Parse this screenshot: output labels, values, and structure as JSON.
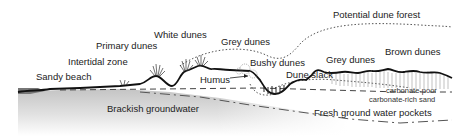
{
  "diagram": {
    "type": "coastal dune cross-section",
    "labels": {
      "sandy_beach": "Sandy beach",
      "intertidal_zone": "Intertidal zone",
      "primary_dunes": "Primary dunes",
      "white_dunes": "White dunes",
      "grey_dunes_left": "Grey dunes",
      "humus": "Humus",
      "bushy_dunes": "Bushy dunes",
      "dune_slack": "Dune slack",
      "grey_dunes_right": "Grey dunes",
      "potential_dune_forest": "Potential dune forest",
      "brown_dunes": "Brown dunes",
      "carbonate_poor": "carbonate-poor",
      "carbonate_rich_sand": "carbonate-rich sand",
      "brackish_groundwater": "Brackish groundwater",
      "fresh_ground_water_pockets": "Fresh ground water pockets"
    },
    "colors": {
      "ground_line": "#111111",
      "groundwater_fill": "#cfcfcf",
      "dashed_line": "#444444",
      "dotted_line": "#555555",
      "vegetation": "#333333"
    }
  }
}
